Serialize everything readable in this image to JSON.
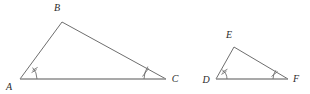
{
  "figure": {
    "background_color": "#ffffff",
    "stroke_color": "#6e6e6e",
    "label_color": "#2b2b2b",
    "baseline_color": "#8c8c8c"
  },
  "triangles": [
    {
      "id": "triangle-abc",
      "name": "ABC",
      "vertices": [
        {
          "label": "A",
          "x": 20,
          "y": 79,
          "label_x": 9,
          "label_y": 90
        },
        {
          "label": "B",
          "x": 62,
          "y": 22,
          "label_x": 57,
          "label_y": 11
        },
        {
          "label": "C",
          "x": 166,
          "y": 79,
          "label_x": 175,
          "label_y": 82
        }
      ],
      "angle_marks": [
        {
          "at": "A",
          "ticks": 2,
          "arc_radius": 17
        },
        {
          "at": "C",
          "ticks": 1,
          "arc_radius": 22
        }
      ]
    },
    {
      "id": "triangle-def",
      "name": "DEF",
      "vertices": [
        {
          "label": "D",
          "x": 216,
          "y": 79,
          "label_x": 206,
          "label_y": 83
        },
        {
          "label": "E",
          "x": 234,
          "y": 47,
          "label_x": 229,
          "label_y": 38
        },
        {
          "label": "F",
          "x": 288,
          "y": 79,
          "label_x": 296,
          "label_y": 82
        }
      ],
      "angle_marks": [
        {
          "at": "D",
          "ticks": 2,
          "arc_radius": 11
        },
        {
          "at": "F",
          "ticks": 1,
          "arc_radius": 15
        }
      ]
    }
  ],
  "labels": {
    "a": "A",
    "b": "B",
    "c": "C",
    "d": "D",
    "e": "E",
    "f": "F"
  }
}
